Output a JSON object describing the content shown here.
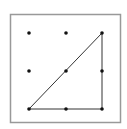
{
  "diagram": {
    "type": "geoboard",
    "frame": {
      "x": 10.5,
      "y": 14.5,
      "width": 110,
      "height": 108,
      "stroke": "#999999"
    },
    "grid": {
      "columns": 3,
      "rows": 3,
      "xs": [
        29,
        66,
        102
      ],
      "ys": [
        33,
        71,
        109
      ],
      "dot_color": "#111111",
      "dot_radius": 1.8
    },
    "triangle": {
      "vertices": [
        [
          29,
          109
        ],
        [
          102,
          33
        ],
        [
          102,
          109
        ]
      ],
      "stroke": "#333333"
    }
  }
}
